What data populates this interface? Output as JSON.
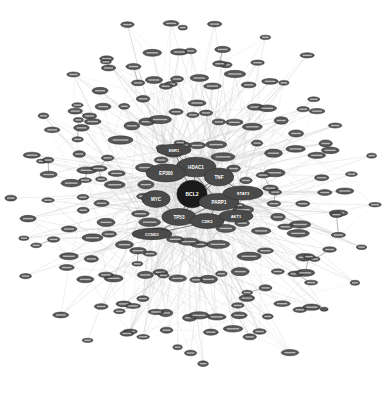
{
  "figure": {
    "kind": "network-graph",
    "title": "",
    "background": "#ffffff",
    "width": 386,
    "height": 394
  },
  "style": {
    "node_fill": "#4a4a4a",
    "node_fill_dark": "#1a1a1a",
    "node_stroke": "#2b2b2b",
    "node_label_color": "#ffffff",
    "edge_color": "#cccccc",
    "edge_color_strong": "#8a8a8a",
    "edge_label_color": "#bdbdbd"
  },
  "chart_data": {
    "type": "scatter",
    "title": "",
    "xlabel": "",
    "ylabel": "",
    "layout": "force-directed radial hairball",
    "center": [
      193,
      195
    ],
    "radius": 175,
    "node_count": 184,
    "edge_count": 430,
    "hubs": [
      {
        "id": "BCL2",
        "label": "BCL2",
        "x": 192,
        "y": 194,
        "r": 13.5,
        "tier": "core",
        "degree": 96
      },
      {
        "id": "HDAC1",
        "label": "HDAC1",
        "x": 196,
        "y": 167,
        "r": 10.5,
        "tier": "major",
        "degree": 58
      },
      {
        "id": "TNF",
        "label": "TNF",
        "x": 219,
        "y": 177,
        "r": 9.5,
        "tier": "major",
        "degree": 51
      },
      {
        "id": "EP300",
        "label": "EP300",
        "x": 166,
        "y": 173,
        "r": 9.5,
        "tier": "major",
        "degree": 47
      },
      {
        "id": "MYC",
        "label": "MYC",
        "x": 156,
        "y": 199,
        "r": 9.0,
        "tier": "major",
        "degree": 44
      },
      {
        "id": "PARP1",
        "label": "PARP1",
        "x": 219,
        "y": 202,
        "r": 9.0,
        "tier": "major",
        "degree": 41
      },
      {
        "id": "TP53",
        "label": "TP53",
        "x": 179,
        "y": 217,
        "r": 9.0,
        "tier": "major",
        "degree": 40
      },
      {
        "id": "CDK2",
        "label": "CDK2",
        "x": 207,
        "y": 221,
        "r": 8.0,
        "tier": "minor",
        "degree": 29
      },
      {
        "id": "STAT3",
        "label": "STAT3",
        "x": 243,
        "y": 193,
        "r": 7.5,
        "tier": "minor",
        "degree": 24
      },
      {
        "id": "AKT1",
        "label": "AKT1",
        "x": 236,
        "y": 216,
        "r": 6.5,
        "tier": "minor",
        "degree": 19
      },
      {
        "id": "ESR1",
        "label": "ESR1",
        "x": 174,
        "y": 150,
        "r": 6.0,
        "tier": "minor",
        "degree": 17
      },
      {
        "id": "CCND1",
        "label": "CCND1",
        "x": 152,
        "y": 234,
        "r": 6.0,
        "tier": "minor",
        "degree": 16
      }
    ],
    "rings": [
      {
        "name": "inner",
        "radius": 52,
        "count": 22,
        "node_r": 4.4
      },
      {
        "name": "mid",
        "radius": 86,
        "count": 34,
        "node_r": 4.1
      },
      {
        "name": "outer",
        "radius": 120,
        "count": 46,
        "node_r": 3.8
      },
      {
        "name": "rim",
        "radius": 152,
        "count": 44,
        "node_r": 3.4
      },
      {
        "name": "fringe",
        "radius": 172,
        "count": 26,
        "node_r": 3.0
      }
    ]
  }
}
